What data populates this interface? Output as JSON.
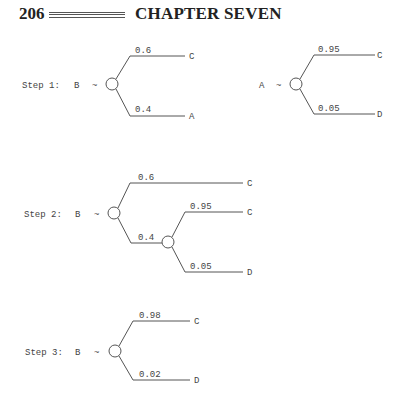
{
  "header": {
    "page_number": "206",
    "chapter_title": "CHAPTER SEVEN"
  },
  "trees": {
    "step1": {
      "label": "Step 1:",
      "root": "B",
      "dash": "~",
      "upper": {
        "prob": "0.6",
        "outcome": "C"
      },
      "lower": {
        "prob": "0.4",
        "outcome": "A"
      }
    },
    "a_tree": {
      "root": "A",
      "dash": "~",
      "upper": {
        "prob": "0.95",
        "outcome": "C"
      },
      "lower": {
        "prob": "0.05",
        "outcome": "D"
      }
    },
    "step2": {
      "label": "Step 2:",
      "root": "B",
      "dash": "~",
      "upper": {
        "prob": "0.6",
        "outcome": "C"
      },
      "lower": {
        "prob": "0.4"
      },
      "sub_upper": {
        "prob": "0.95",
        "outcome": "C"
      },
      "sub_lower": {
        "prob": "0.05",
        "outcome": "D"
      }
    },
    "step3": {
      "label": "Step 3:",
      "root": "B",
      "dash": "~",
      "upper": {
        "prob": "0.98",
        "outcome": "C"
      },
      "lower": {
        "prob": "0.02",
        "outcome": "D"
      }
    }
  }
}
